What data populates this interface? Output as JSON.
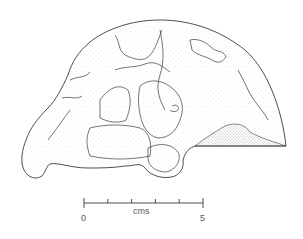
{
  "figure": {
    "view": "lateral"
  },
  "scale_bar": {
    "unit_label": "cms",
    "start_label": "0",
    "end_label": "5",
    "ticks": [
      0,
      1,
      2,
      3,
      4,
      5
    ]
  },
  "colors": {
    "ink": "#3a3a3a",
    "stipple": "#8a8a8a",
    "background": "#ffffff"
  }
}
